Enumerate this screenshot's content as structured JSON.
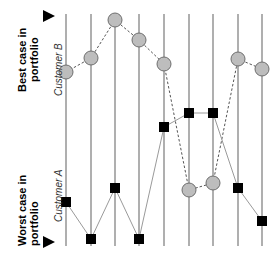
{
  "labels": {
    "best_case_line1": "Best case in",
    "best_case_line2": "portfolio",
    "worst_case_line1": "Worst case in",
    "worst_case_line2": "portfolio",
    "series_b": "Customer B",
    "series_a": "Customer A"
  },
  "colors": {
    "line": "#7a7a7a",
    "circle_fill": "#bdbdbd",
    "circle_stroke": "#6e6e6e",
    "square_fill": "#000000",
    "dash": "#555555",
    "solid_connector": "#9a9a9a"
  },
  "axes_x": [
    66,
    91,
    115,
    139,
    164,
    189,
    213,
    238,
    262
  ],
  "axis_top": 14,
  "axis_bottom": 246,
  "chart_data": {
    "type": "parallel-coordinates",
    "title": "",
    "orientation": "top = best case, bottom = worst case",
    "axis_count": 9,
    "series": [
      {
        "name": "Customer B",
        "marker": "circle",
        "line": "dashed",
        "values": [
          72,
          58,
          20,
          40,
          64,
          190,
          183,
          59,
          69
        ]
      },
      {
        "name": "Customer A",
        "marker": "square",
        "line": "solid",
        "values": [
          202,
          239,
          188,
          239,
          127,
          113,
          113,
          188,
          221
        ]
      }
    ]
  }
}
